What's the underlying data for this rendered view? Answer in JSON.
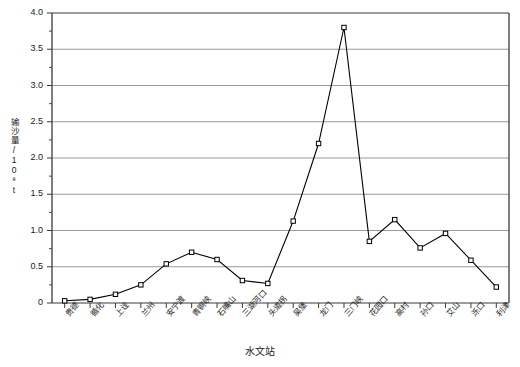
{
  "chart_data": {
    "type": "line",
    "title": "",
    "xlabel": "水文站",
    "ylabel": "输沙量/10⁸t",
    "ylim": [
      0,
      4.0
    ],
    "yticks": [
      "0",
      "0.5",
      "1.0",
      "1.5",
      "2.0",
      "2.5",
      "3.0",
      "3.5",
      "4.0"
    ],
    "ytick_values": [
      0,
      0.5,
      1.0,
      1.5,
      2.0,
      2.5,
      3.0,
      3.5,
      4.0
    ],
    "grid": true,
    "legend": "none",
    "marker": "open-square",
    "line_color": "#000000",
    "grid_color": "#808080",
    "categories": [
      "贵德",
      "循化",
      "上诠",
      "兰州",
      "安宁渡",
      "青铜峡",
      "石嘴山",
      "三湖河口",
      "头道拐",
      "吴堡",
      "龙门",
      "三门峡",
      "花园口",
      "高村",
      "孙口",
      "艾山",
      "泺口",
      "利津"
    ],
    "values": [
      0.03,
      0.05,
      0.12,
      0.25,
      0.54,
      0.7,
      0.6,
      0.31,
      0.27,
      1.13,
      2.2,
      3.8,
      0.85,
      1.15,
      0.76,
      0.96,
      0.59,
      0.22
    ]
  }
}
